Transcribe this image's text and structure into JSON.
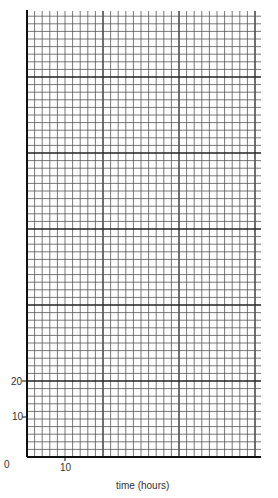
{
  "chart_data": {
    "type": "line",
    "title": "",
    "xlabel": "time (hours)",
    "ylabel": "",
    "x_ticks": [
      {
        "value": 0,
        "label": "0"
      },
      {
        "value": 10,
        "label": "10"
      }
    ],
    "y_ticks": [
      {
        "value": 10,
        "label": "10"
      },
      {
        "value": 20,
        "label": "20"
      }
    ],
    "xlim": [
      0,
      59
    ],
    "ylim": [
      0,
      116
    ],
    "grid": true,
    "minor_square_units": 2,
    "major_every_squares": 10,
    "series": [],
    "note": "Blank graph paper grid for plotting; no data plotted"
  },
  "labels": {
    "origin": "0",
    "x10": "10",
    "y10": "10",
    "y20": "20",
    "xaxis_title": "time (hours)"
  }
}
